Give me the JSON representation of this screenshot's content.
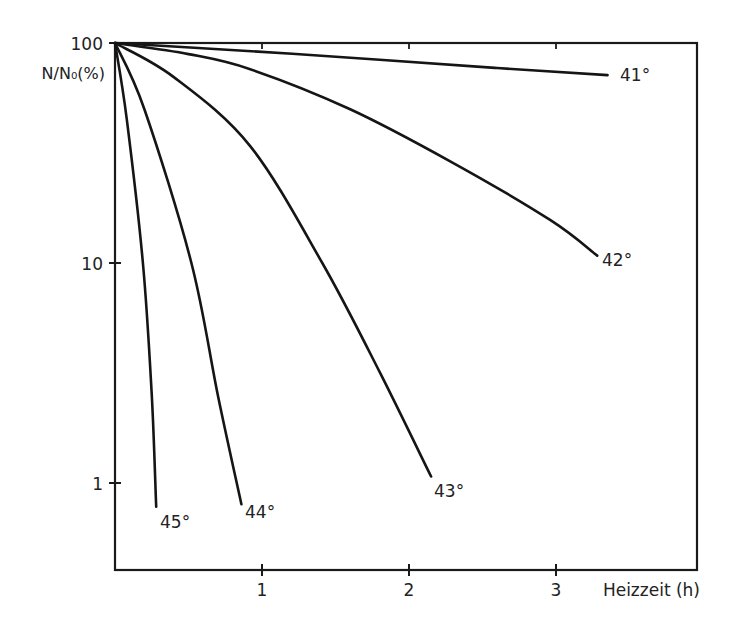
{
  "chart_data": {
    "type": "line",
    "title": "",
    "xlabel": "Heizzeit (h)",
    "ylabel": "N/N₀(%)",
    "yscale": "log",
    "xlim": [
      0,
      3.97
    ],
    "ylim": [
      0.4,
      100
    ],
    "x_ticks": [
      1,
      2,
      3
    ],
    "x_tick_labels": [
      "1",
      "2",
      "3"
    ],
    "y_ticks": [
      100,
      10,
      1
    ],
    "y_tick_labels": [
      "100",
      "10",
      "1"
    ],
    "grid": false,
    "legend": "inline labels at curve ends",
    "series": [
      {
        "name": "41°",
        "x": [
          0,
          0.9,
          1.8,
          2.6,
          3.35
        ],
        "y": [
          100,
          92,
          84,
          77,
          71.5
        ]
      },
      {
        "name": "42°",
        "x": [
          0,
          0.5,
          0.92,
          1.6,
          2.28,
          2.96,
          3.28
        ],
        "y": [
          100,
          89,
          76,
          50,
          29,
          15.7,
          10.8
        ]
      },
      {
        "name": "43°",
        "x": [
          0,
          0.4,
          0.92,
          1.41,
          1.8,
          2.15
        ],
        "y": [
          100,
          70,
          34,
          10,
          3.2,
          1.07
        ]
      },
      {
        "name": "44°",
        "x": [
          0,
          0.2,
          0.52,
          0.7,
          0.86
        ],
        "y": [
          100,
          50,
          10,
          2.5,
          0.8
        ]
      },
      {
        "name": "45°",
        "x": [
          0,
          0.08,
          0.19,
          0.25,
          0.28
        ],
        "y": [
          100,
          45,
          10,
          2.5,
          0.78
        ]
      }
    ]
  },
  "labels": {
    "y_top": "100",
    "y_mid": "10",
    "y_low": "1",
    "y_axis_title": "N/N₀(%)",
    "x1": "1",
    "x2": "2",
    "x3": "3",
    "x_axis_title": "Heizzeit (h)",
    "curve_41": "41°",
    "curve_42": "42°",
    "curve_43": "43°",
    "curve_44": "44°",
    "curve_45": "45°"
  }
}
